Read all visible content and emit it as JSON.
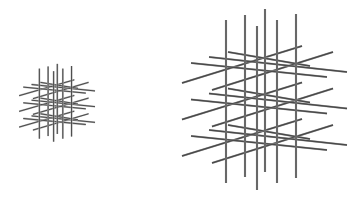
{
  "figure": {
    "background": "#ffffff",
    "rod_color": "#4a4a4a",
    "rod_edge_color": "#b0b0b0"
  },
  "lattice": {
    "layer_offsets": [
      0,
      36.5,
      73
    ],
    "verticals": [
      [
        226,
        20,
        183
      ],
      [
        245,
        15,
        177
      ],
      [
        257,
        26,
        190
      ],
      [
        265,
        9,
        172
      ],
      [
        277,
        20,
        183
      ],
      [
        296,
        14,
        178
      ]
    ],
    "layer_rods": [
      [
        182,
        83,
        302,
        46
      ],
      [
        212,
        90,
        333,
        52
      ],
      [
        191,
        63,
        327,
        77
      ],
      [
        209,
        57,
        347,
        72
      ],
      [
        228,
        52,
        310,
        66
      ]
    ]
  },
  "instances": [
    {
      "name": "small-lattice",
      "sx": 0.46,
      "sy": 0.43,
      "tx": -64.6,
      "ty": 60,
      "stroke": 1.0
    },
    {
      "name": "large-lattice",
      "sx": 1,
      "sy": 1,
      "tx": 0,
      "ty": 0,
      "stroke": 1.4
    }
  ]
}
